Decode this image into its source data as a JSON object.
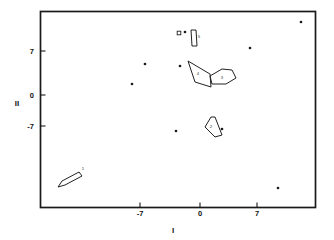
{
  "chart_data": {
    "type": "scatter",
    "title": "",
    "xlabel": "I",
    "ylabel": "II",
    "xlim": [
      -14.5,
      11.5
    ],
    "ylim": [
      -16.5,
      12.5
    ],
    "xticks": [
      -7,
      0,
      7
    ],
    "xticklabels": [
      "-7",
      "0",
      "7"
    ],
    "yticks": [
      -7,
      0,
      7
    ],
    "yticklabels": [
      "-7",
      "0",
      "7"
    ],
    "grid": false,
    "legend": "none",
    "points": [
      {
        "x": -4.1,
        "y": 9.3,
        "px": 185,
        "py": 32
      },
      {
        "x": 9.9,
        "y": 10.9,
        "px": 301,
        "py": 22
      },
      {
        "x": 4.9,
        "y": 7.3,
        "px": 250,
        "py": 48
      },
      {
        "x": -5.2,
        "y": 1.3,
        "px": 180,
        "py": 66
      },
      {
        "x": -7.3,
        "y": 1.5,
        "px": 145,
        "py": 64
      },
      {
        "x": -8.2,
        "y": -0.8,
        "px": 132,
        "py": 84
      },
      {
        "x": -2.7,
        "y": -7.6,
        "px": 176,
        "py": 131
      },
      {
        "x": 2.2,
        "y": -7.4,
        "px": 222,
        "py": 129
      },
      {
        "x": 8.8,
        "y": -13.9,
        "px": 278,
        "py": 188
      }
    ],
    "regions": [
      {
        "name": "region-1",
        "label": "1",
        "points_px": "58,187 62,181 79,172 82,176 65,185",
        "label_px": [
          83,
          170
        ]
      },
      {
        "name": "region-2",
        "label": "2",
        "points_px": "205,127 211,117 215,117 222,135 215,137",
        "label_px": [
          211,
          128
        ]
      },
      {
        "name": "region-3",
        "label": "3",
        "points_px": "210,76 222,69 232,70 236,78 226,84 212,84",
        "label_px": [
          222,
          79
        ]
      },
      {
        "name": "region-4",
        "label": "4",
        "points_px": "188,61 210,74 211,87 195,82",
        "label_px": [
          198,
          75
        ]
      },
      {
        "name": "region-5",
        "label": "5",
        "points_px": "191,30 196,30 197,46 192,46",
        "label_px": [
          199,
          38
        ]
      }
    ],
    "markers": [
      {
        "name": "marker-square",
        "px": 179,
        "py": 33,
        "size": 3.6
      }
    ]
  }
}
